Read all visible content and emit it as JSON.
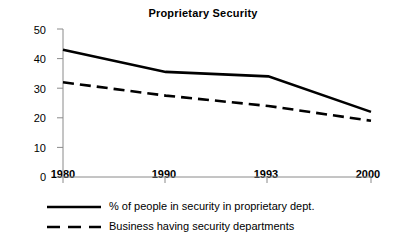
{
  "chart_data": {
    "type": "line",
    "title": "Proprietary Security",
    "xlabel": "",
    "ylabel": "Percent",
    "categories": [
      "1980",
      "1990",
      "1993",
      "2000"
    ],
    "x_ticks": [
      "1980",
      "1990",
      "1993",
      "2000"
    ],
    "y_ticks": [
      "0",
      "10",
      "20",
      "30",
      "40",
      "50"
    ],
    "ylim": [
      0,
      50
    ],
    "grid": false,
    "legend_position": "below",
    "series": [
      {
        "name": "% of people in security in proprietary dept.",
        "style": "solid",
        "color": "#000000",
        "values": [
          43,
          35.5,
          34,
          22
        ]
      },
      {
        "name": "Business having security departments",
        "style": "dashed",
        "color": "#000000",
        "values": [
          32,
          27.5,
          24,
          19
        ]
      }
    ]
  },
  "legend": {
    "entries": [
      {
        "label": "% of people in security in proprietary dept.",
        "style": "solid"
      },
      {
        "label": "Business having security departments",
        "style": "dashed"
      }
    ]
  },
  "colors": {
    "background": "#ffffff",
    "ink": "#000000",
    "axis": "#8a8a8a"
  }
}
